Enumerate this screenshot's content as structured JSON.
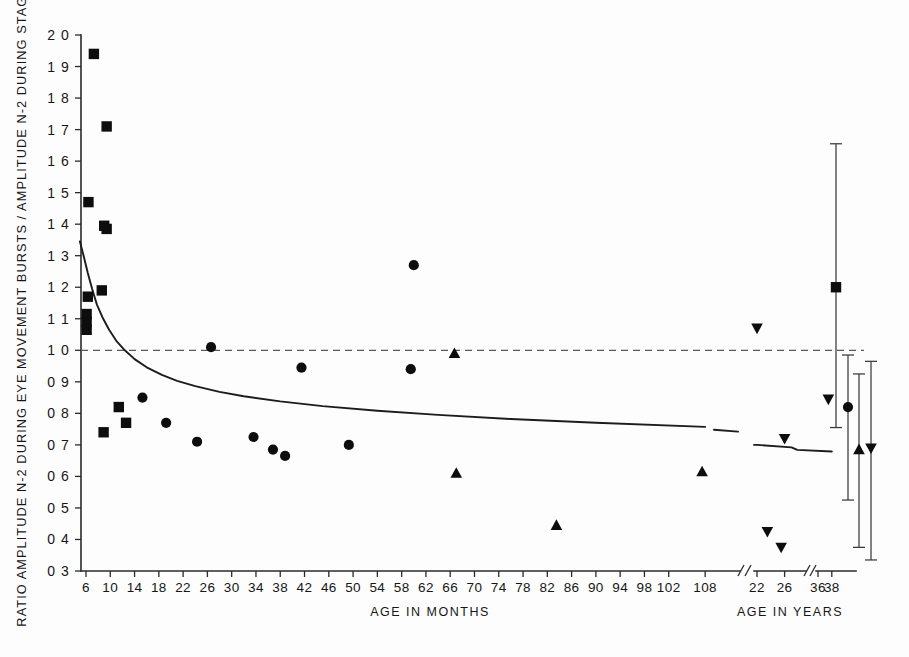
{
  "figure": {
    "background_color": "#fdfdfd",
    "ink_color": "#0d0d0d"
  },
  "axes": {
    "ylabel": "RATIO AMPLITUDE N-2 DURING EYE MOVEMENT  BURSTS / AMPLITUDE N-2 DURING STAGE 2",
    "xlabel_months": "AGE IN MONTHS",
    "xlabel_years": "AGE IN YEARS",
    "y_ticks": [
      "2 0",
      "1 9",
      "1 8",
      "1 7",
      "1 6",
      "1 5",
      "1 4",
      "1 3",
      "1 2",
      "1 1",
      "1 0",
      "0 9",
      "0 8",
      "0 7",
      "0 6",
      "0 5",
      "0 4",
      "0 3"
    ],
    "x_ticks_months": [
      "6",
      "10",
      "14",
      "18",
      "22",
      "26",
      "30",
      "34",
      "38",
      "42",
      "46",
      "50",
      "54",
      "58",
      "62",
      "66",
      "70",
      "74",
      "78",
      "82",
      "86",
      "90",
      "94",
      "98",
      "102",
      "108"
    ],
    "x_ticks_years": [
      "22",
      "26",
      "36",
      "38"
    ],
    "axis_breaks": 3,
    "reference_line_value": "1 0"
  },
  "chart_data": {
    "type": "scatter",
    "title": "",
    "xlabel": "AGE IN MONTHS",
    "ylabel": "RATIO AMPLITUDE N-2 DURING EYE MOVEMENT BURSTS / AMPLITUDE N-2 DURING STAGE 2",
    "ylim": [
      0.3,
      2.0
    ],
    "xlim_months": [
      4,
      110
    ],
    "xlim_years": [
      21,
      39
    ],
    "grid": false,
    "legend": "none",
    "reference_line": {
      "y": 1.0,
      "style": "dashed",
      "label": "ratio = 1 0"
    },
    "fit_curve": {
      "style": "solid",
      "description": "decaying power-law fit from age 5 months to 38 years",
      "points": [
        {
          "x": 5.0,
          "y": 1.345
        },
        {
          "x": 5.6,
          "y": 1.3
        },
        {
          "x": 6.3,
          "y": 1.245
        },
        {
          "x": 7.0,
          "y": 1.195
        },
        {
          "x": 7.8,
          "y": 1.145
        },
        {
          "x": 8.7,
          "y": 1.105
        },
        {
          "x": 9.8,
          "y": 1.065
        },
        {
          "x": 11.0,
          "y": 1.03
        },
        {
          "x": 12.4,
          "y": 1.0
        },
        {
          "x": 14.0,
          "y": 0.972
        },
        {
          "x": 16.0,
          "y": 0.946
        },
        {
          "x": 18.5,
          "y": 0.922
        },
        {
          "x": 21.0,
          "y": 0.903
        },
        {
          "x": 24.0,
          "y": 0.886
        },
        {
          "x": 28.0,
          "y": 0.868
        },
        {
          "x": 32.0,
          "y": 0.854
        },
        {
          "x": 38.0,
          "y": 0.838
        },
        {
          "x": 45.0,
          "y": 0.823
        },
        {
          "x": 54.0,
          "y": 0.808
        },
        {
          "x": 64.0,
          "y": 0.795
        },
        {
          "x": 76.0,
          "y": 0.782
        },
        {
          "x": 90.0,
          "y": 0.77
        },
        {
          "x": 108.0,
          "y": 0.757
        }
      ],
      "years_points": [
        {
          "x": 22.0,
          "y": 0.7
        },
        {
          "x": 27.0,
          "y": 0.692
        },
        {
          "x": 33.0,
          "y": 0.684
        },
        {
          "x": 38.0,
          "y": 0.679
        }
      ]
    },
    "series": [
      {
        "name": "infants",
        "marker": "square",
        "axis": "months",
        "points": [
          {
            "x": 7.3,
            "y": 1.94
          },
          {
            "x": 9.4,
            "y": 1.71
          },
          {
            "x": 6.4,
            "y": 1.47
          },
          {
            "x": 9.0,
            "y": 1.395
          },
          {
            "x": 9.4,
            "y": 1.385
          },
          {
            "x": 8.6,
            "y": 1.19
          },
          {
            "x": 6.3,
            "y": 1.17
          },
          {
            "x": 6.1,
            "y": 1.115
          },
          {
            "x": 6.1,
            "y": 1.09
          },
          {
            "x": 6.1,
            "y": 1.065
          },
          {
            "x": 11.4,
            "y": 0.82
          },
          {
            "x": 12.6,
            "y": 0.77
          },
          {
            "x": 8.9,
            "y": 0.74
          }
        ]
      },
      {
        "name": "children",
        "marker": "circle",
        "axis": "months",
        "points": [
          {
            "x": 60.0,
            "y": 1.27
          },
          {
            "x": 26.6,
            "y": 1.01
          },
          {
            "x": 41.5,
            "y": 0.945
          },
          {
            "x": 59.5,
            "y": 0.94
          },
          {
            "x": 15.3,
            "y": 0.85
          },
          {
            "x": 19.2,
            "y": 0.77
          },
          {
            "x": 33.6,
            "y": 0.725
          },
          {
            "x": 24.3,
            "y": 0.71
          },
          {
            "x": 49.3,
            "y": 0.7
          },
          {
            "x": 36.8,
            "y": 0.685
          },
          {
            "x": 38.8,
            "y": 0.665
          }
        ]
      },
      {
        "name": "adolescents",
        "marker": "triangle-up",
        "axis": "months",
        "points": [
          {
            "x": 66.7,
            "y": 0.99
          },
          {
            "x": 67.0,
            "y": 0.61
          },
          {
            "x": 83.5,
            "y": 0.445
          },
          {
            "x": 107.5,
            "y": 0.615
          }
        ]
      },
      {
        "name": "adults",
        "marker": "triangle-down",
        "axis": "years",
        "points": [
          {
            "x": 22.0,
            "y": 1.07
          },
          {
            "x": 37.5,
            "y": 0.845
          },
          {
            "x": 26.0,
            "y": 0.72
          },
          {
            "x": 23.5,
            "y": 0.425
          },
          {
            "x": 25.5,
            "y": 0.375
          }
        ]
      }
    ],
    "summary_error_bars": {
      "description": "group means with ranges, plotted to the right of the axis",
      "bars": [
        {
          "group": "infants",
          "marker": "square",
          "mean": 1.2,
          "low": 0.755,
          "high": 1.655
        },
        {
          "group": "children",
          "marker": "circle",
          "mean": 0.82,
          "low": 0.525,
          "high": 0.985
        },
        {
          "group": "adolescents",
          "marker": "triangle-up",
          "mean": 0.685,
          "low": 0.375,
          "high": 0.925
        },
        {
          "group": "adults",
          "marker": "triangle-down",
          "mean": 0.69,
          "low": 0.335,
          "high": 0.965
        }
      ]
    }
  }
}
